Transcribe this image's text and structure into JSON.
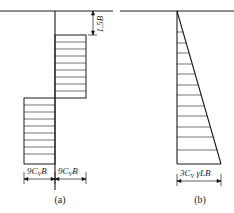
{
  "diagram_a": {
    "caption": "(a)",
    "dim_depth_label": "1.5B",
    "left_width_label": "9C",
    "left_width_sub": "V",
    "left_width_tail": "B",
    "right_width_label": "9C",
    "right_width_sub": "V",
    "right_width_tail": "B"
  },
  "diagram_b": {
    "caption": "(b)",
    "base_label": "3C",
    "base_sub": "V",
    "base_tail": " γLB"
  },
  "colors": {
    "line": "#1a1a1a",
    "hatch": "#333333",
    "background": "#ffffff"
  }
}
